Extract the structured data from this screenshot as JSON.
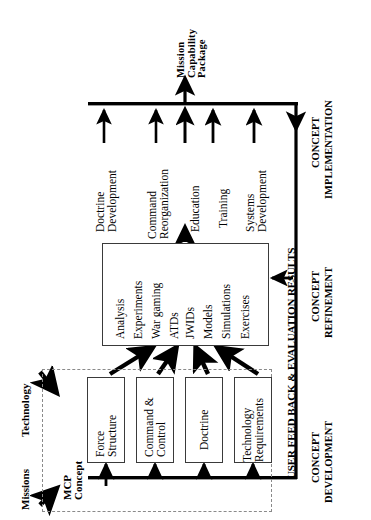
{
  "diagram": {
    "output_label": "Mission\nCapability\nPackage",
    "inputs": {
      "missions": "Missions",
      "technology": "Technology"
    },
    "mcp_concept_label": "MCP\nConcept",
    "feedback_label": "USER FEED BACK & EVALUATION RESULTS",
    "phases": [
      {
        "id": "development",
        "line1": "CONCEPT",
        "line2": "DEVELOPMENT"
      },
      {
        "id": "refinement",
        "line1": "CONCEPT",
        "line2": "REFINEMENT"
      },
      {
        "id": "implementation",
        "line1": "CONCEPT",
        "line2": "IMPLEMENTATION"
      }
    ],
    "development_boxes": [
      {
        "id": "force-structure",
        "label": "Force\nStructure"
      },
      {
        "id": "command-control",
        "label": "Command &\nControl"
      },
      {
        "id": "doctrine",
        "label": "Doctrine"
      },
      {
        "id": "technology-requirements",
        "label": "Technology\nRequirements"
      }
    ],
    "refinement_items": [
      "Analysis",
      "Experiments",
      "War gaming",
      "ATDs",
      "JWIDs",
      "Models",
      "Simulations",
      "Exercises"
    ],
    "implementation_items": [
      {
        "id": "doctrine-development",
        "label": "Doctrine\nDevelopment"
      },
      {
        "id": "command-reorganization",
        "label": "Command\nReorganization"
      },
      {
        "id": "education",
        "label": "Education"
      },
      {
        "id": "training",
        "label": "Training"
      },
      {
        "id": "systems-development",
        "label": "Systems\nDevelopment"
      }
    ],
    "colors": {
      "ink": "#000000",
      "box_border": "#3a3a3a",
      "dashed_border": "#8a8a8a",
      "background": "#ffffff"
    }
  }
}
